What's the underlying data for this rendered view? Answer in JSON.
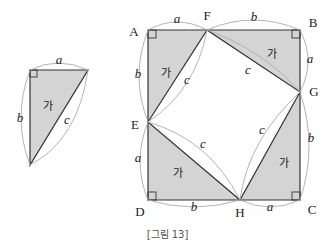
{
  "figure": {
    "caption": "[그림 13]",
    "colors": {
      "fill": "#d4d4d4",
      "stroke": "#333333",
      "arc": "#aaaaaa",
      "text": "#222222"
    }
  },
  "small_triangle": {
    "region_label": "가",
    "side_labels": {
      "top": "a",
      "left": "b",
      "hypotenuse": "c"
    }
  },
  "square": {
    "vertices": {
      "A": "A",
      "B": "B",
      "C": "C",
      "D": "D"
    },
    "points": {
      "E": "E",
      "F": "F",
      "G": "G",
      "H": "H"
    },
    "triangle_labels": [
      "가",
      "가",
      "가",
      "가"
    ],
    "side_labels": {
      "AF": "a",
      "FB": "b",
      "BG": "a",
      "GC": "b",
      "CH": "a",
      "HD": "b",
      "DE": "a",
      "EA": "b",
      "FG": "c",
      "GH": "c",
      "HE": "c",
      "EF": "c"
    }
  }
}
